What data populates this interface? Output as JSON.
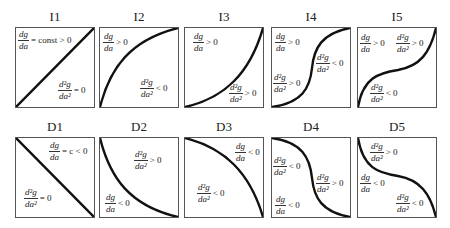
{
  "panels": [
    {
      "id": "I1",
      "x": 15,
      "y": 27,
      "curve": "M0,79 L78,0",
      "labels": [
        {
          "num": "dg",
          "den": "da",
          "rel": "= const > 0",
          "x": 2,
          "y": 2
        },
        {
          "num": "d²g",
          "den": "da²",
          "rel": "= 0",
          "x": 42,
          "y": 52
        }
      ]
    },
    {
      "id": "I2",
      "x": 99,
      "y": 27,
      "curve": "M0,79 C10,40 30,12 78,0",
      "labels": [
        {
          "num": "dg",
          "den": "da",
          "rel": "> 0",
          "x": 3,
          "y": 4
        },
        {
          "num": "d²g",
          "den": "da²",
          "rel": "< 0",
          "x": 40,
          "y": 50
        }
      ]
    },
    {
      "id": "I3",
      "x": 184,
      "y": 27,
      "curve": "M0,79 C40,70 65,45 78,0",
      "labels": [
        {
          "num": "dg",
          "den": "da",
          "rel": "> 0",
          "x": 8,
          "y": 4
        },
        {
          "num": "d²g",
          "den": "da²",
          "rel": "> 0",
          "x": 44,
          "y": 55
        }
      ]
    },
    {
      "id": "I4",
      "x": 271,
      "y": 27,
      "curve": "M0,79 C30,75 38,60 40,40 C42,20 50,5 78,0",
      "labels": [
        {
          "num": "dg",
          "den": "da",
          "rel": "> 0",
          "x": 3,
          "y": 4
        },
        {
          "num": "d²g",
          "den": "da²",
          "rel": "< 0",
          "x": 44,
          "y": 25
        },
        {
          "num": "d²g",
          "den": "da²",
          "rel": "> 0",
          "x": 1,
          "y": 45
        }
      ]
    },
    {
      "id": "I5",
      "x": 357,
      "y": 27,
      "curve": "M0,79 C5,50 20,45 40,42 C62,38 72,25 78,0",
      "labels": [
        {
          "num": "dg",
          "den": "da",
          "rel": "> 0",
          "x": 2,
          "y": 5
        },
        {
          "num": "d²g",
          "den": "da²",
          "rel": "> 0",
          "x": 38,
          "y": 5
        },
        {
          "num": "d²g",
          "den": "da²",
          "rel": "< 0",
          "x": 12,
          "y": 55
        }
      ]
    },
    {
      "id": "D1",
      "x": 15,
      "y": 137,
      "curve": "M0,0 L78,79",
      "labels": [
        {
          "num": "dg",
          "den": "da",
          "rel": "= c < 0",
          "x": 33,
          "y": 3
        },
        {
          "num": "d²g",
          "den": "da²",
          "rel": "= 0",
          "x": 8,
          "y": 50
        }
      ]
    },
    {
      "id": "D2",
      "x": 99,
      "y": 137,
      "curve": "M0,0 C10,40 30,68 78,79",
      "labels": [
        {
          "num": "d²g",
          "den": "da²",
          "rel": "> 0",
          "x": 34,
          "y": 12
        },
        {
          "num": "dg",
          "den": "da",
          "rel": "< 0",
          "x": 5,
          "y": 55
        }
      ]
    },
    {
      "id": "D3",
      "x": 184,
      "y": 137,
      "curve": "M0,0 C40,10 65,35 78,79",
      "labels": [
        {
          "num": "dg",
          "den": "da",
          "rel": "< 0",
          "x": 50,
          "y": 4
        },
        {
          "num": "d²g",
          "den": "da²",
          "rel": "< 0",
          "x": 12,
          "y": 45
        }
      ]
    },
    {
      "id": "D4",
      "x": 271,
      "y": 137,
      "curve": "M0,0 C30,4 38,20 40,40 C42,60 50,74 78,79",
      "labels": [
        {
          "num": "d²g",
          "den": "da²",
          "rel": "< 0",
          "x": 1,
          "y": 18
        },
        {
          "num": "d²g",
          "den": "da²",
          "rel": "> 0",
          "x": 44,
          "y": 35
        },
        {
          "num": "dg",
          "den": "da",
          "rel": "< 0",
          "x": 3,
          "y": 57
        }
      ]
    },
    {
      "id": "D5",
      "x": 357,
      "y": 137,
      "curve": "M0,0 C5,30 20,35 40,38 C62,42 72,55 78,79",
      "labels": [
        {
          "num": "d²g",
          "den": "da²",
          "rel": "> 0",
          "x": 12,
          "y": 4
        },
        {
          "num": "dg",
          "den": "da",
          "rel": "< 0",
          "x": 2,
          "y": 35
        },
        {
          "num": "d²g",
          "den": "da²",
          "rel": "< 0",
          "x": 38,
          "y": 55
        }
      ]
    }
  ]
}
